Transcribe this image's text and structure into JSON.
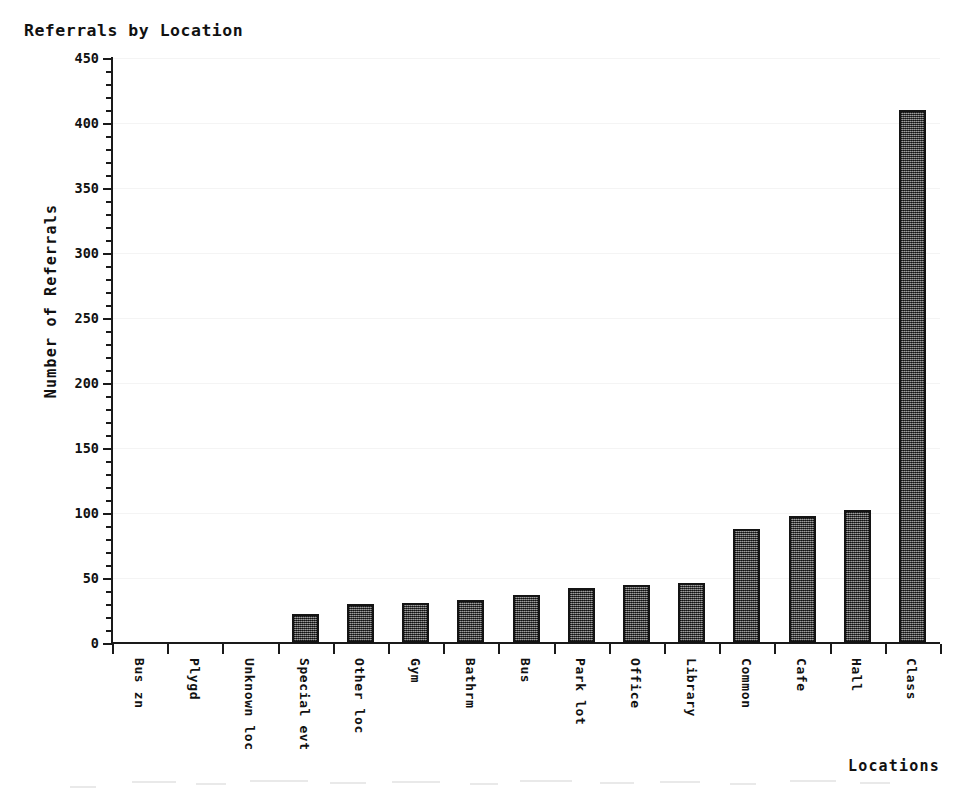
{
  "chart_data": {
    "type": "bar",
    "title": "Referrals by Location",
    "xlabel": "Locations",
    "ylabel": "Number of Referrals",
    "categories": [
      "Bus zn",
      "Plygd",
      "Unknown loc",
      "Special evt",
      "Other loc",
      "Gym",
      "Bathrm",
      "Bus",
      "Park lot",
      "Office",
      "Library",
      "Common",
      "Cafe",
      "Hall",
      "Class"
    ],
    "values": [
      0,
      0,
      0,
      22,
      30,
      31,
      33,
      37,
      42,
      45,
      46,
      88,
      98,
      102,
      410
    ],
    "ylim": [
      0,
      450
    ],
    "ytick_labels": [
      "0",
      "50",
      "100",
      "150",
      "200",
      "250",
      "300",
      "350",
      "400",
      "450"
    ],
    "ytick_values": [
      0,
      50,
      100,
      150,
      200,
      250,
      300,
      350,
      400,
      450
    ],
    "yminor_step": 10,
    "grid": true,
    "legend": "none",
    "bar_color": "#4a4a4a",
    "bar_edge_color": "#141414",
    "axis_color": "#1a1a1a",
    "background_color": "#ffffff",
    "gridline_color": "#f4f4f4"
  }
}
